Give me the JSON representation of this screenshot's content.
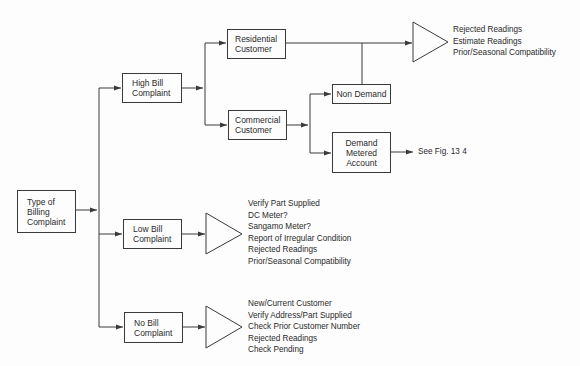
{
  "diagram": {
    "root": {
      "lines": [
        "Type of",
        "Billing",
        "Complaint"
      ]
    },
    "high_bill": {
      "lines": [
        "High Bill",
        "Complaint"
      ]
    },
    "low_bill": {
      "lines": [
        "Low Bill",
        "Complaint"
      ]
    },
    "no_bill": {
      "lines": [
        "No Bill",
        "Complaint"
      ]
    },
    "residential": {
      "lines": [
        "Residential",
        "Customer"
      ]
    },
    "commercial": {
      "lines": [
        "Commercial",
        "Customer"
      ]
    },
    "non_demand": {
      "lines": [
        "Non Demand"
      ]
    },
    "demand_metered": {
      "lines": [
        "Demand",
        "Metered",
        "Account"
      ]
    },
    "demand_reference": "See Fig. 13 4",
    "high_bill_checks": [
      "Rejected Readings",
      "Estimate Readings",
      "Prior/Seasonal Compatibility"
    ],
    "low_bill_checks": [
      "Verify Part Supplied",
      "DC Meter?",
      "Sangamo Meter?",
      "Report of Irregular Condition",
      "Rejected Readings",
      "Prior/Seasonal Compatibility"
    ],
    "no_bill_checks": [
      "New/Current Customer",
      "Verify Address/Part Supplied",
      "Check Prior Customer Number",
      "Rejected Readings",
      "Check Pending"
    ],
    "colors": {
      "line": "#3a3a3a",
      "text": "#2a2a2a",
      "background": "#fdfdfd"
    }
  }
}
